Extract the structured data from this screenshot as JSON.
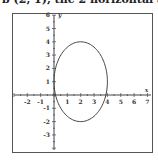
{
  "header_text": "b (2, 1), the 2 horizontal axis and",
  "chart_data": {
    "type": "line",
    "title": "",
    "xlabel": "x",
    "ylabel": "y",
    "xlim": [
      -3,
      7
    ],
    "ylim": [
      -4,
      6
    ],
    "x_ticks": [
      -2,
      -1,
      1,
      2,
      3,
      4,
      5,
      6,
      7
    ],
    "y_ticks": [
      -3,
      -2,
      -1,
      1,
      2,
      3,
      4,
      5,
      6
    ],
    "grid": false,
    "curve": {
      "name": "ellipse",
      "equation": "(x-2)^2/4 + (y-1)^2/9 = 1",
      "center": [
        2,
        1
      ],
      "semi_axis_x": 2,
      "semi_axis_y": 3,
      "key_points": [
        [
          0,
          1
        ],
        [
          4,
          1
        ],
        [
          2,
          4
        ],
        [
          2,
          -2
        ]
      ]
    },
    "colors": {
      "curve": "#444444",
      "axes": "#444444",
      "frame": "#555555"
    }
  }
}
